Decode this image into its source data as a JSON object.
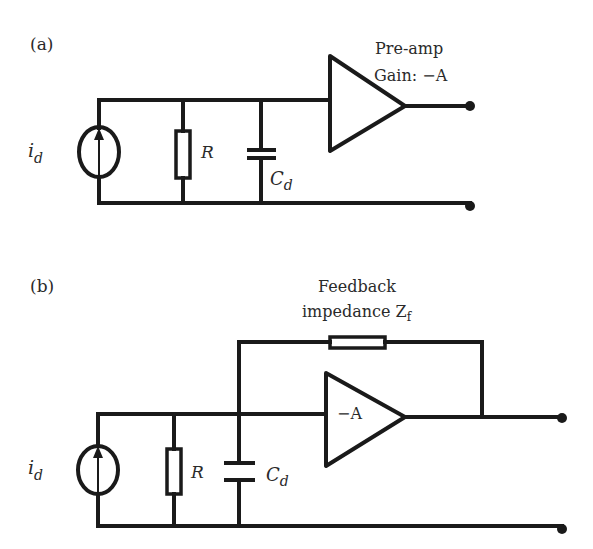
{
  "diagram": {
    "panel_a": {
      "label": "(a)",
      "source_label": "i",
      "source_sub": "d",
      "resistor_label": "R",
      "capacitor_label": "C",
      "capacitor_sub": "d",
      "amp_title_line1": "Pre-amp",
      "amp_title_line2": "Gain: −A"
    },
    "panel_b": {
      "label": "(b)",
      "source_label": "i",
      "source_sub": "d",
      "resistor_label": "R",
      "capacitor_label": "C",
      "capacitor_sub": "d",
      "amp_label": "−A",
      "feedback_line1": "Feedback",
      "feedback_line2": "impedance Z",
      "feedback_sub": "f"
    },
    "colors": {
      "line": "#1a1a1a",
      "text": "#2a2a2a",
      "background": "#ffffff"
    }
  }
}
